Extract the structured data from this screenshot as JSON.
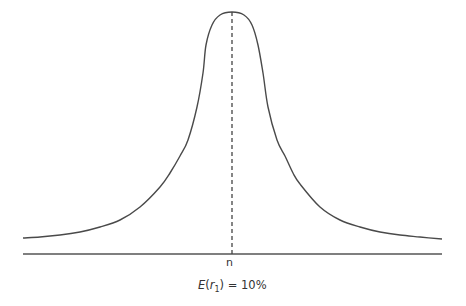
{
  "diagram": {
    "type": "bell-shaped probability distribution",
    "axis_label": "n",
    "caption": {
      "prefix_italic_E": "E",
      "open": "(",
      "var_italic": "r",
      "subscript": "1",
      "close": ")",
      "rest": " = 10%"
    },
    "colors": {
      "curve": "#4a4a4a",
      "baseline": "#555555",
      "dashed_line": "#444444",
      "text": "#333333"
    },
    "curve_points": [
      [
        23,
        238
      ],
      [
        40,
        237
      ],
      [
        60,
        235
      ],
      [
        80,
        232
      ],
      [
        100,
        227
      ],
      [
        120,
        220
      ],
      [
        140,
        207
      ],
      [
        160,
        187
      ],
      [
        170,
        173
      ],
      [
        180,
        156
      ],
      [
        188,
        140
      ],
      [
        197,
        107
      ],
      [
        203,
        73
      ],
      [
        206,
        45
      ],
      [
        212,
        25
      ],
      [
        220,
        15
      ],
      [
        232,
        12
      ],
      [
        244,
        15
      ],
      [
        252,
        25
      ],
      [
        258,
        45
      ],
      [
        263,
        73
      ],
      [
        268,
        107
      ],
      [
        277,
        140
      ],
      [
        285,
        156
      ],
      [
        293,
        173
      ],
      [
        300,
        184
      ],
      [
        320,
        207
      ],
      [
        340,
        220
      ],
      [
        360,
        227
      ],
      [
        380,
        232
      ],
      [
        400,
        235
      ],
      [
        420,
        237
      ],
      [
        442,
        239
      ]
    ],
    "baseline": {
      "x1": 23,
      "x2": 442,
      "y": 254
    },
    "mean_line": {
      "x": 232,
      "y1": 12,
      "y2": 254
    }
  }
}
